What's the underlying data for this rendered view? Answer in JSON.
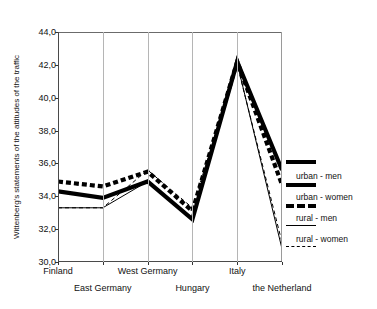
{
  "axis": {
    "ylabel": "Wittenberg's statements of the attitudes of the traffic",
    "yticks": [
      "44,0",
      "42,0",
      "40,0",
      "38,0",
      "36,0",
      "34,0",
      "32,0",
      "30,0"
    ]
  },
  "legend": {
    "items": [
      {
        "label": "urban - men",
        "style": "thick-solid"
      },
      {
        "label": "urban - women",
        "style": "thick-dashed"
      },
      {
        "label": "rural - men",
        "style": "thin-solid"
      },
      {
        "label": "rural - women",
        "style": "thin-dashed"
      }
    ]
  },
  "chart_data": {
    "type": "line",
    "title": "",
    "xlabel": "",
    "ylabel": "Wittenberg's statements of the attitudes of the traffic",
    "categories": [
      "Finland",
      "East Germany",
      "West Germany",
      "Hungary",
      "Italy",
      "the Netherland"
    ],
    "ylim": [
      30.0,
      44.0
    ],
    "ytick_values": [
      30.0,
      32.0,
      34.0,
      36.0,
      38.0,
      40.0,
      42.0,
      44.0
    ],
    "grid": "vertical",
    "legend_position": "right",
    "series": [
      {
        "name": "urban - men",
        "style": "thick-solid",
        "values": [
          34.3,
          33.9,
          34.9,
          32.6,
          42.2,
          35.6
        ]
      },
      {
        "name": "urban - women",
        "style": "thick-dashed",
        "values": [
          34.9,
          34.6,
          35.5,
          33.1,
          42.2,
          34.7
        ]
      },
      {
        "name": "rural - men",
        "style": "thin-solid",
        "values": [
          33.3,
          33.3,
          34.9,
          32.7,
          42.1,
          30.8
        ]
      },
      {
        "name": "rural - women",
        "style": "thin-dashed",
        "values": [
          33.3,
          33.3,
          35.6,
          33.3,
          42.0,
          31.2
        ]
      }
    ]
  }
}
